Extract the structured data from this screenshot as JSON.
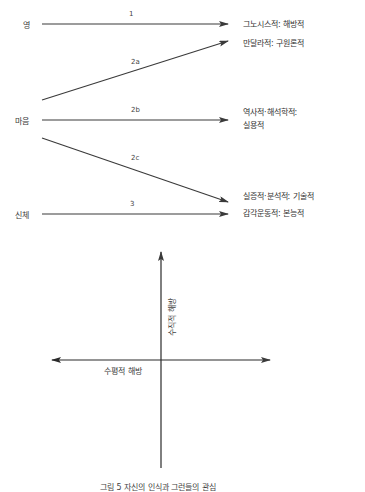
{
  "sources": [
    {
      "id": "spirit",
      "label": "영"
    },
    {
      "id": "mind",
      "label": "마음"
    },
    {
      "id": "body",
      "label": "신체"
    }
  ],
  "paths": [
    {
      "id": "1",
      "label": "1",
      "from": "영",
      "to": "그노시스적: 해방적"
    },
    {
      "id": "2a",
      "label": "2a",
      "from": "마음",
      "to": "만달라적: 구원론적"
    },
    {
      "id": "2b",
      "label": "2b",
      "from": "마음",
      "to": "역사적·해석학적: 실용적"
    },
    {
      "id": "2c",
      "label": "2c",
      "from": "마음",
      "to": "실증적·분석적: 기술적"
    },
    {
      "id": "3",
      "label": "3",
      "from": "신체",
      "to": "감각운동적: 본능적"
    }
  ],
  "targets": [
    {
      "line1": "그노시스적: 해방적"
    },
    {
      "line1": "만달라적: 구원론적"
    },
    {
      "line1": "역사적·해석학적:",
      "line2": "실용적"
    },
    {
      "line1": "실증적·분석적: 기술적"
    },
    {
      "line1": "감각운동적: 본능적"
    }
  ],
  "axes": {
    "vertical_label": "수직적 해방",
    "horizontal_label": "수평적 해방"
  },
  "caption": "그림 5 자신의 인식과 그런들의 관심",
  "colors": {
    "line": "#3a3a3a",
    "text": "#3a3a3a",
    "background": "#ffffff"
  }
}
